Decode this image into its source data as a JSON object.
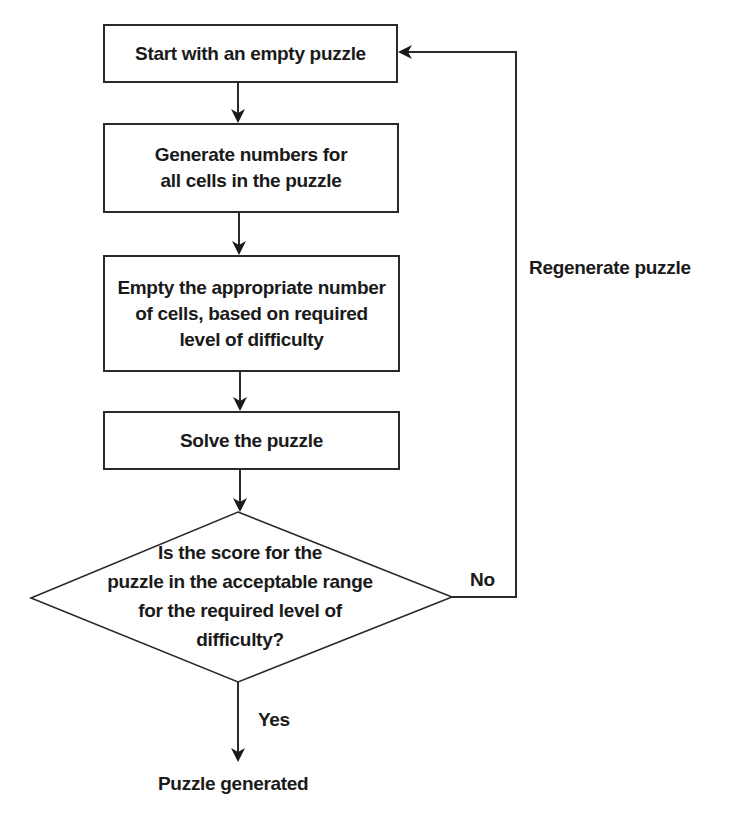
{
  "diagram": {
    "type": "flowchart",
    "nodes": [
      {
        "id": "start",
        "shape": "rectangle",
        "text": "Start with an empty puzzle"
      },
      {
        "id": "generate",
        "shape": "rectangle",
        "text": "Generate numbers for\nall cells in the puzzle"
      },
      {
        "id": "empty",
        "shape": "rectangle",
        "text": "Empty the appropriate number\nof cells, based on required\nlevel of difficulty"
      },
      {
        "id": "solve",
        "shape": "rectangle",
        "text": "Solve the puzzle"
      },
      {
        "id": "decision",
        "shape": "diamond",
        "text": "Is the score for the\npuzzle in the acceptable range\nfor the required level of\ndifficulty?"
      },
      {
        "id": "end",
        "shape": "text",
        "text": "Puzzle generated"
      }
    ],
    "edges": [
      {
        "from": "start",
        "to": "generate",
        "label": ""
      },
      {
        "from": "generate",
        "to": "empty",
        "label": ""
      },
      {
        "from": "empty",
        "to": "solve",
        "label": ""
      },
      {
        "from": "solve",
        "to": "decision",
        "label": ""
      },
      {
        "from": "decision",
        "to": "end",
        "label": "Yes"
      },
      {
        "from": "decision",
        "to": "start",
        "label": "No"
      }
    ],
    "labels": {
      "yes": "Yes",
      "no": "No",
      "loop": "Regenerate puzzle"
    },
    "colors": {
      "stroke": "#2a2a2a",
      "text": "#1a1a1a",
      "background": "#ffffff"
    }
  }
}
